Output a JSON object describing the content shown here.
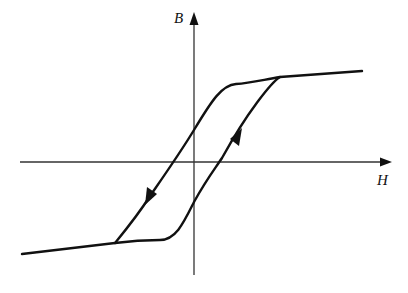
{
  "diagram": {
    "type": "hysteresis-loop",
    "y_axis_label": "B",
    "x_axis_label": "H",
    "line_color": "#111111",
    "background": "#ffffff",
    "branches": [
      {
        "name": "descending-branch",
        "direction": "decreasing H (arrow pointing down-left)"
      },
      {
        "name": "ascending-branch",
        "direction": "increasing H (arrow pointing up-right)"
      }
    ]
  }
}
